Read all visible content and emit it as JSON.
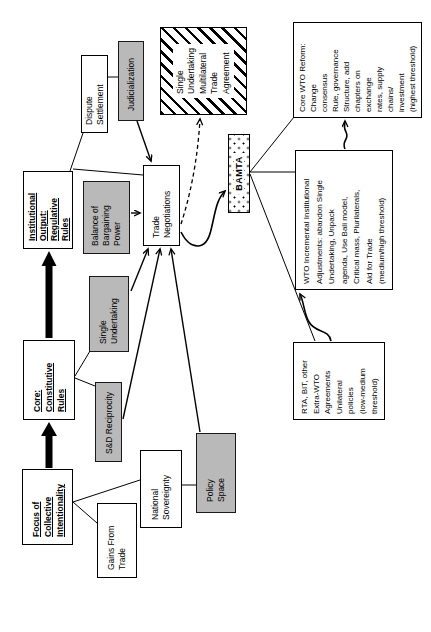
{
  "figure": {
    "description": "Flow diagram of WTO institutional reform pathways, rotated 90 degrees on the page",
    "colors": {
      "shaded_box": "#b9b9b9",
      "line": "#000000",
      "background": "#ffffff"
    }
  },
  "boxes": {
    "focus": {
      "lines": [
        "Focus of",
        "Collective",
        "Intentionality"
      ]
    },
    "core": {
      "lines": [
        "Core:",
        "Constitutive",
        "Rules"
      ]
    },
    "inst_output": {
      "lines": [
        "Institutional",
        "Output:",
        "Regulative",
        "Rules"
      ]
    },
    "gains": {
      "lines": [
        "Gains From",
        "Trade"
      ]
    },
    "nat_sov": {
      "lines": [
        "National",
        "Sovereignty"
      ]
    },
    "sd_recip": {
      "lines": [
        "S&D Reciprocity"
      ]
    },
    "single_und": {
      "lines": [
        "Single",
        "Undertaking"
      ]
    },
    "policy": {
      "lines": [
        "Policy",
        "Space"
      ]
    },
    "balance": {
      "lines": [
        "Balance of",
        "Bargaining",
        "Power"
      ]
    },
    "trade_neg": {
      "lines": [
        "Trade",
        "Negotiations"
      ]
    },
    "dispute": {
      "lines": [
        "Dispute",
        "Settlement"
      ]
    },
    "judicial": {
      "lines": [
        "Judicialization"
      ]
    },
    "sumta": {
      "lines": [
        "Single",
        "Undertaking",
        "Multilateral",
        "Trade",
        "Agreement"
      ]
    },
    "bamta": {
      "lines": [
        "BAMTA"
      ]
    },
    "rta": {
      "lines": [
        "RTA, BIT, other",
        "Extra-WTO",
        "Agreements",
        "Unilateral",
        "policies",
        "(low-medium",
        "threshold)"
      ]
    },
    "wto_incr": {
      "lines": [
        "WTO Incremental Institutional",
        "Adjustments: abandon Single",
        "Undertaking, Unpack",
        "agenda, Use Bali model,",
        "Critical mass, Plurilaterals,",
        "Aid for Trade",
        "(medium/high threshold)"
      ]
    },
    "reform": {
      "lines": [
        "Core WTO Reform:",
        "Change",
        "consensus",
        "Rule, governance",
        "Structure, add",
        "chapters on",
        "exchange",
        "rates, supply",
        "chains/",
        "investment",
        "(highest threshold)"
      ]
    }
  }
}
